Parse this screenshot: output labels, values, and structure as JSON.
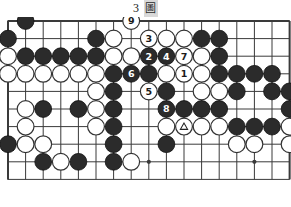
{
  "caption": {
    "number": "3",
    "word": "圖",
    "full": "3 圖"
  },
  "board": {
    "kind": "go-board-diagram",
    "cols": 17,
    "rows": 10,
    "origin_x": 8,
    "origin_y": 4,
    "spacing": 17.6,
    "stone_radius": 8.4,
    "line_color": "#3a3a3a",
    "border_color": "#3a3a3a",
    "black_color": "#2b2b2b",
    "white_color": "#ffffff",
    "background_color": "#ffffff",
    "star_points": [
      {
        "col": 2,
        "row": 8
      },
      {
        "col": 8,
        "row": 8
      },
      {
        "col": 14,
        "row": 8
      }
    ],
    "stones": [
      {
        "col": 1,
        "row": 0,
        "color": "black"
      },
      {
        "col": 7,
        "row": 0,
        "color": "white",
        "label": "9"
      },
      {
        "col": 0,
        "row": 1,
        "color": "black"
      },
      {
        "col": 5,
        "row": 1,
        "color": "black"
      },
      {
        "col": 6,
        "row": 1,
        "color": "white"
      },
      {
        "col": 8,
        "row": 1,
        "color": "white",
        "label": "3"
      },
      {
        "col": 9,
        "row": 1,
        "color": "white"
      },
      {
        "col": 10,
        "row": 1,
        "color": "white"
      },
      {
        "col": 11,
        "row": 1,
        "color": "black"
      },
      {
        "col": 12,
        "row": 1,
        "color": "black"
      },
      {
        "col": 0,
        "row": 2,
        "color": "white"
      },
      {
        "col": 1,
        "row": 2,
        "color": "black"
      },
      {
        "col": 2,
        "row": 2,
        "color": "black"
      },
      {
        "col": 3,
        "row": 2,
        "color": "black"
      },
      {
        "col": 4,
        "row": 2,
        "color": "black"
      },
      {
        "col": 5,
        "row": 2,
        "color": "black"
      },
      {
        "col": 6,
        "row": 2,
        "color": "white"
      },
      {
        "col": 7,
        "row": 2,
        "color": "white"
      },
      {
        "col": 8,
        "row": 2,
        "color": "black",
        "label": "2"
      },
      {
        "col": 9,
        "row": 2,
        "color": "black",
        "label": "4"
      },
      {
        "col": 10,
        "row": 2,
        "color": "white",
        "label": "7"
      },
      {
        "col": 11,
        "row": 2,
        "color": "white"
      },
      {
        "col": 12,
        "row": 2,
        "color": "black"
      },
      {
        "col": 0,
        "row": 3,
        "color": "white"
      },
      {
        "col": 1,
        "row": 3,
        "color": "white"
      },
      {
        "col": 2,
        "row": 3,
        "color": "white"
      },
      {
        "col": 3,
        "row": 3,
        "color": "white"
      },
      {
        "col": 4,
        "row": 3,
        "color": "white"
      },
      {
        "col": 5,
        "row": 3,
        "color": "white"
      },
      {
        "col": 6,
        "row": 3,
        "color": "black"
      },
      {
        "col": 7,
        "row": 3,
        "color": "black",
        "label": "6"
      },
      {
        "col": 8,
        "row": 3,
        "color": "black"
      },
      {
        "col": 9,
        "row": 3,
        "color": "white"
      },
      {
        "col": 10,
        "row": 3,
        "color": "white",
        "label": "1"
      },
      {
        "col": 11,
        "row": 3,
        "color": "white"
      },
      {
        "col": 12,
        "row": 3,
        "color": "black"
      },
      {
        "col": 13,
        "row": 3,
        "color": "black"
      },
      {
        "col": 14,
        "row": 3,
        "color": "black"
      },
      {
        "col": 15,
        "row": 3,
        "color": "black"
      },
      {
        "col": 5,
        "row": 4,
        "color": "white"
      },
      {
        "col": 6,
        "row": 4,
        "color": "black"
      },
      {
        "col": 8,
        "row": 4,
        "color": "white",
        "label": "5"
      },
      {
        "col": 9,
        "row": 4,
        "color": "black"
      },
      {
        "col": 11,
        "row": 4,
        "color": "white"
      },
      {
        "col": 12,
        "row": 4,
        "color": "white"
      },
      {
        "col": 13,
        "row": 4,
        "color": "black"
      },
      {
        "col": 15,
        "row": 4,
        "color": "black"
      },
      {
        "col": 16,
        "row": 4,
        "color": "black"
      },
      {
        "col": 1,
        "row": 5,
        "color": "white"
      },
      {
        "col": 2,
        "row": 5,
        "color": "black"
      },
      {
        "col": 4,
        "row": 5,
        "color": "black"
      },
      {
        "col": 5,
        "row": 5,
        "color": "white"
      },
      {
        "col": 6,
        "row": 5,
        "color": "black"
      },
      {
        "col": 9,
        "row": 5,
        "color": "black",
        "label": "8"
      },
      {
        "col": 10,
        "row": 5,
        "color": "black"
      },
      {
        "col": 11,
        "row": 5,
        "color": "black"
      },
      {
        "col": 12,
        "row": 5,
        "color": "black"
      },
      {
        "col": 16,
        "row": 5,
        "color": "black"
      },
      {
        "col": 1,
        "row": 6,
        "color": "white"
      },
      {
        "col": 5,
        "row": 6,
        "color": "white"
      },
      {
        "col": 6,
        "row": 6,
        "color": "black"
      },
      {
        "col": 9,
        "row": 6,
        "color": "white"
      },
      {
        "col": 10,
        "row": 6,
        "color": "white",
        "mark": "triangle"
      },
      {
        "col": 11,
        "row": 6,
        "color": "white"
      },
      {
        "col": 12,
        "row": 6,
        "color": "white"
      },
      {
        "col": 13,
        "row": 6,
        "color": "black"
      },
      {
        "col": 14,
        "row": 6,
        "color": "black"
      },
      {
        "col": 15,
        "row": 6,
        "color": "black"
      },
      {
        "col": 16,
        "row": 6,
        "color": "white"
      },
      {
        "col": 0,
        "row": 7,
        "color": "black"
      },
      {
        "col": 1,
        "row": 7,
        "color": "white"
      },
      {
        "col": 2,
        "row": 7,
        "color": "white"
      },
      {
        "col": 6,
        "row": 7,
        "color": "black"
      },
      {
        "col": 9,
        "row": 7,
        "color": "black"
      },
      {
        "col": 13,
        "row": 7,
        "color": "white"
      },
      {
        "col": 14,
        "row": 7,
        "color": "white"
      },
      {
        "col": 16,
        "row": 7,
        "color": "white"
      },
      {
        "col": 2,
        "row": 8,
        "color": "black"
      },
      {
        "col": 3,
        "row": 8,
        "color": "white"
      },
      {
        "col": 4,
        "row": 8,
        "color": "black"
      },
      {
        "col": 6,
        "row": 8,
        "color": "black"
      },
      {
        "col": 7,
        "row": 8,
        "color": "white"
      }
    ],
    "move_numbers": {
      "1": "white",
      "2": "black",
      "3": "white",
      "4": "black",
      "5": "white",
      "6": "black",
      "7": "white",
      "8": "black",
      "9": "white"
    },
    "marked_stone_note": "triangle-marked white stone"
  }
}
